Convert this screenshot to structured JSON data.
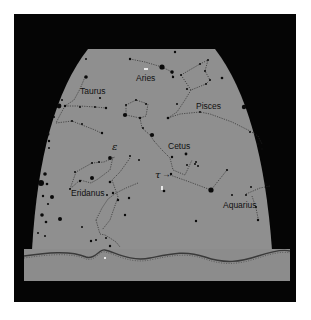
{
  "chart": {
    "type": "star-map",
    "frame_color": "#050505",
    "sky_color": "#8f8f8f",
    "ground_color": "#8c8c8c",
    "line_color": "#2a2a2a",
    "star_color": "#0a0a0a"
  },
  "labels": {
    "aries": "Aries",
    "taurus": "Taurus",
    "pisces": "Pisces",
    "cetus": "Cetus",
    "eridanus": "Eridanus",
    "aquarius": "Aquarius",
    "epsilon": "ε",
    "tau": "τ",
    "tau_arrow": "→"
  },
  "constellations": [
    {
      "name": "Aries",
      "label_pos": [
        135,
        80
      ]
    },
    {
      "name": "Taurus",
      "label_pos": [
        80,
        94
      ]
    },
    {
      "name": "Pisces",
      "label_pos": [
        196,
        109
      ]
    },
    {
      "name": "Cetus",
      "label_pos": [
        168,
        149
      ]
    },
    {
      "name": "Eridanus",
      "label_pos": [
        71,
        196
      ]
    },
    {
      "name": "Aquarius",
      "label_pos": [
        223,
        208
      ]
    }
  ]
}
